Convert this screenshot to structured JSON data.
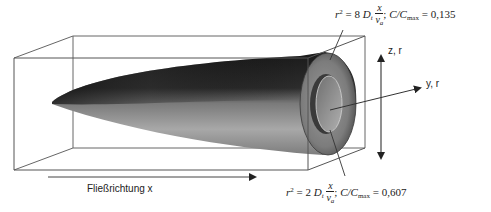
{
  "figure": {
    "annotations": {
      "outer_surface": {
        "lhs_var": "r",
        "lhs_exp": "2",
        "eq": "=",
        "coef": "8",
        "diff_symbol": "D",
        "diff_sub": "t",
        "frac_num": "x",
        "frac_den_var": "v",
        "frac_den_sub": "a",
        "sep": ";",
        "ratio_label": "C/C",
        "ratio_sub": "max",
        "ratio_eq": "=",
        "ratio_value": "0,135"
      },
      "inner_surface": {
        "lhs_var": "r",
        "lhs_exp": "2",
        "eq": "=",
        "coef": "2",
        "diff_symbol": "D",
        "diff_sub": "t",
        "frac_num": "x",
        "frac_den_var": "v",
        "frac_den_sub": "a",
        "sep": ";",
        "ratio_label": "C/C",
        "ratio_sub": "max",
        "ratio_eq": "=",
        "ratio_value": "0,607"
      }
    },
    "axes": {
      "vertical_label": "z, r",
      "lateral_label": "y, r",
      "flow_label": "Fließrichtung x"
    },
    "colors": {
      "outline": "#555555",
      "arrow": "#222222",
      "plume_dark": "#1e1e1e",
      "plume_mid": "#6a6a6a",
      "plume_light": "#b5b5b5",
      "inner_core": "#9a9a9a"
    }
  }
}
